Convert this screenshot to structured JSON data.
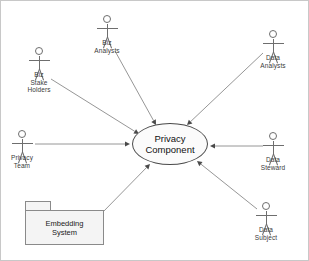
{
  "diagram": {
    "background_color": "#ffffff",
    "line_color": "#8a8a8a",
    "border_color": "#c8c8c8"
  },
  "usecase": {
    "name": "privacy-component",
    "line1": "Privacy",
    "line2": "Component",
    "fill": "#fbfbfb",
    "stroke": "#4a4a4a"
  },
  "package": {
    "name": "embedding-system",
    "line1": "Embedding",
    "line2": "System",
    "fill": "#f4f4f4",
    "stroke": "#8a8a8a"
  },
  "actors": [
    {
      "name": "biz-stake-holders",
      "line1": "Biz",
      "line2": "Stake",
      "line3": "Holders",
      "x": 38,
      "y": 46
    },
    {
      "name": "biz-analysts",
      "line1": "Biz",
      "line2": "Analysts",
      "line3": "",
      "x": 106,
      "y": 14
    },
    {
      "name": "data-analysts",
      "line1": "Data",
      "line2": "Analysts",
      "line3": "",
      "x": 272,
      "y": 29
    },
    {
      "name": "privacy-team",
      "line1": "Privacy",
      "line2": "Team",
      "line3": "",
      "x": 21,
      "y": 129
    },
    {
      "name": "data-steward",
      "line1": "Data",
      "line2": "Steward",
      "line3": "",
      "x": 272,
      "y": 131
    },
    {
      "name": "data-subject",
      "line1": "Data",
      "line2": "Subject",
      "line3": "",
      "x": 265,
      "y": 201
    }
  ],
  "connections": [
    {
      "name": "connection-biz-stake-holders",
      "from": "biz-stake-holders",
      "to": "privacy-component",
      "x1": 50,
      "y1": 78,
      "x2": 138,
      "y2": 133
    },
    {
      "name": "connection-biz-analysts",
      "from": "biz-analysts",
      "to": "privacy-component",
      "x1": 114,
      "y1": 50,
      "x2": 155,
      "y2": 124
    },
    {
      "name": "connection-data-analysts",
      "from": "data-analysts",
      "to": "privacy-component",
      "x1": 262,
      "y1": 52,
      "x2": 186,
      "y2": 124
    },
    {
      "name": "connection-privacy-team",
      "from": "privacy-team",
      "to": "privacy-component",
      "x1": 34,
      "y1": 143,
      "x2": 129,
      "y2": 143
    },
    {
      "name": "connection-data-steward",
      "from": "data-steward",
      "to": "privacy-component",
      "x1": 262,
      "y1": 145,
      "x2": 209,
      "y2": 145
    },
    {
      "name": "connection-data-subject",
      "from": "data-subject",
      "to": "privacy-component",
      "x1": 256,
      "y1": 208,
      "x2": 196,
      "y2": 160
    },
    {
      "name": "connection-embedding-system",
      "from": "embedding-system",
      "to": "privacy-component",
      "x1": 101,
      "y1": 212,
      "x2": 149,
      "y2": 163
    }
  ]
}
